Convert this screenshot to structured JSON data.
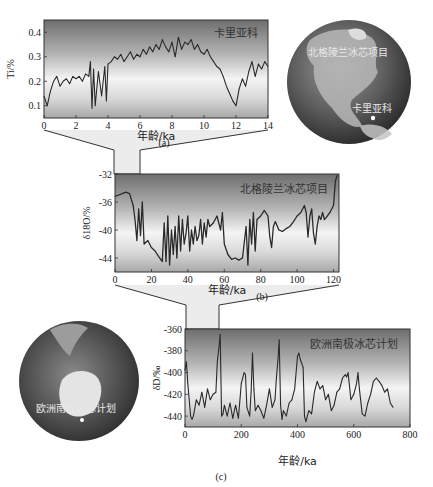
{
  "chart_data": [
    {
      "id": "a",
      "type": "line",
      "caption": "(a)",
      "annotation": "卡里亚科",
      "xlabel": "年龄/ka",
      "ylabel": "Ti/%",
      "xlim": [
        0,
        14
      ],
      "ylim": [
        0.05,
        0.45
      ],
      "xticks": [
        "0",
        "2",
        "4",
        "6",
        "8",
        "10",
        "12",
        "14"
      ],
      "xtick_values": [
        0,
        2,
        4,
        6,
        8,
        10,
        12,
        14
      ],
      "yticks": [
        "0.1",
        "0.2",
        "0.3",
        "0.4"
      ],
      "ytick_values": [
        0.1,
        0.2,
        0.3,
        0.4
      ],
      "series": [
        {
          "name": "Cariaco Ti",
          "x": [
            0,
            0.2,
            0.4,
            0.6,
            0.8,
            1.0,
            1.2,
            1.4,
            1.6,
            1.8,
            2.0,
            2.2,
            2.4,
            2.6,
            2.8,
            2.9,
            3.0,
            3.1,
            3.2,
            3.4,
            3.6,
            3.8,
            3.9,
            4.0,
            4.2,
            4.4,
            4.6,
            4.8,
            5.0,
            5.2,
            5.4,
            5.6,
            5.8,
            6.0,
            6.2,
            6.4,
            6.6,
            6.8,
            7.0,
            7.2,
            7.4,
            7.6,
            7.8,
            8.0,
            8.2,
            8.4,
            8.6,
            8.8,
            9.0,
            9.2,
            9.4,
            9.6,
            9.8,
            10.0,
            10.2,
            10.4,
            10.6,
            10.8,
            11.0,
            11.2,
            11.4,
            11.6,
            11.8,
            12.0,
            12.2,
            12.4,
            12.6,
            12.8,
            13.0,
            13.2,
            13.4,
            13.6,
            13.8,
            14.0
          ],
          "values": [
            0.14,
            0.1,
            0.16,
            0.2,
            0.22,
            0.18,
            0.2,
            0.21,
            0.19,
            0.22,
            0.21,
            0.22,
            0.2,
            0.23,
            0.22,
            0.28,
            0.09,
            0.25,
            0.1,
            0.24,
            0.14,
            0.26,
            0.12,
            0.27,
            0.28,
            0.3,
            0.29,
            0.31,
            0.28,
            0.3,
            0.32,
            0.29,
            0.31,
            0.3,
            0.33,
            0.31,
            0.34,
            0.32,
            0.35,
            0.33,
            0.37,
            0.34,
            0.32,
            0.36,
            0.3,
            0.38,
            0.33,
            0.36,
            0.35,
            0.37,
            0.33,
            0.35,
            0.32,
            0.31,
            0.33,
            0.3,
            0.28,
            0.26,
            0.25,
            0.22,
            0.18,
            0.15,
            0.12,
            0.1,
            0.17,
            0.21,
            0.18,
            0.24,
            0.28,
            0.22,
            0.27,
            0.25,
            0.28,
            0.26
          ]
        }
      ]
    },
    {
      "id": "b",
      "type": "line",
      "caption": "(b)",
      "annotation": "北格陵兰冰芯项目",
      "xlabel": "年龄/ka",
      "ylabel": "δ18O/%",
      "ylabel_parts": {
        "delta": "δ",
        "sup": "18",
        "rest": "O/%"
      },
      "xlim": [
        0,
        123
      ],
      "ylim": [
        -46,
        -32
      ],
      "xticks": [
        "0",
        "20",
        "40",
        "60",
        "80",
        "100",
        "120"
      ],
      "xtick_values": [
        0,
        20,
        40,
        60,
        80,
        100,
        120
      ],
      "yticks": [
        "-32",
        "-36",
        "-40",
        "-44"
      ],
      "ytick_values": [
        -32,
        -36,
        -40,
        -44
      ],
      "series": [
        {
          "name": "NGRIP δ18O",
          "x": [
            0,
            2,
            4,
            6,
            8,
            10,
            11,
            12,
            13,
            14,
            15,
            16,
            18,
            20,
            22,
            24,
            26,
            27,
            28,
            29,
            30,
            31,
            32,
            33,
            34,
            35,
            36,
            37,
            38,
            39,
            40,
            41,
            42,
            43,
            44,
            45,
            46,
            47,
            48,
            49,
            50,
            51,
            52,
            54,
            56,
            58,
            59,
            60,
            62,
            64,
            66,
            68,
            70,
            72,
            73,
            74,
            75,
            76,
            77,
            78,
            80,
            82,
            84,
            85,
            86,
            87,
            88,
            90,
            92,
            94,
            96,
            98,
            100,
            102,
            104,
            105,
            106,
            107,
            108,
            109,
            110,
            111,
            112,
            113,
            114,
            115,
            116,
            118,
            120,
            121,
            122
          ],
          "values": [
            -35.2,
            -35.0,
            -34.8,
            -34.6,
            -34.8,
            -36.5,
            -38.5,
            -41.5,
            -37.0,
            -40.8,
            -36.0,
            -42.0,
            -41.5,
            -42.5,
            -43.0,
            -43.8,
            -44.5,
            -39.0,
            -44.5,
            -38.0,
            -45.0,
            -40.0,
            -43.5,
            -39.5,
            -44.0,
            -38.0,
            -43.0,
            -38.5,
            -42.0,
            -40.5,
            -38.0,
            -43.0,
            -40.0,
            -42.0,
            -39.5,
            -41.5,
            -40.8,
            -38.5,
            -42.0,
            -39.0,
            -41.0,
            -38.5,
            -39.5,
            -39.0,
            -38.0,
            -40.0,
            -37.5,
            -42.0,
            -43.5,
            -44.2,
            -44.0,
            -44.3,
            -44.0,
            -39.5,
            -45.0,
            -38.5,
            -42.0,
            -37.5,
            -43.0,
            -38.5,
            -38.0,
            -37.2,
            -38.0,
            -41.0,
            -42.5,
            -39.5,
            -38.8,
            -40.0,
            -40.2,
            -39.8,
            -39.5,
            -38.8,
            -38.0,
            -37.5,
            -36.5,
            -37.5,
            -41.0,
            -38.0,
            -37.0,
            -40.5,
            -42.0,
            -39.5,
            -38.0,
            -38.5,
            -37.5,
            -38.5,
            -38.2,
            -37.5,
            -36.5,
            -33.0,
            -32.2
          ]
        }
      ]
    },
    {
      "id": "c",
      "type": "line",
      "caption": "(c)",
      "annotation": "欧洲南极冰芯计划",
      "xlabel": "年龄/ka",
      "ylabel": "δD/‰",
      "xlim": [
        0,
        800
      ],
      "ylim": [
        -450,
        -360
      ],
      "xticks": [
        "0",
        "200",
        "400",
        "600",
        "800"
      ],
      "xtick_values": [
        0,
        200,
        400,
        600,
        800
      ],
      "yticks": [
        "-360",
        "-380",
        "-400",
        "-420",
        "-440"
      ],
      "ytick_values": [
        -360,
        -380,
        -400,
        -420,
        -440
      ],
      "series": [
        {
          "name": "EPICA δD",
          "x": [
            0,
            5,
            10,
            15,
            20,
            25,
            30,
            40,
            50,
            60,
            70,
            80,
            90,
            100,
            110,
            115,
            120,
            125,
            130,
            135,
            140,
            150,
            160,
            170,
            180,
            190,
            200,
            210,
            215,
            220,
            230,
            235,
            240,
            245,
            250,
            260,
            270,
            280,
            290,
            300,
            310,
            320,
            325,
            330,
            335,
            340,
            345,
            350,
            360,
            370,
            380,
            390,
            400,
            405,
            410,
            420,
            425,
            430,
            440,
            450,
            460,
            470,
            480,
            490,
            500,
            510,
            520,
            530,
            540,
            550,
            560,
            570,
            575,
            580,
            590,
            600,
            610,
            615,
            620,
            630,
            640,
            650,
            660,
            670,
            680,
            690,
            700,
            710,
            720,
            730,
            740
          ],
          "values": [
            -398,
            -390,
            -410,
            -425,
            -440,
            -443,
            -440,
            -425,
            -430,
            -418,
            -432,
            -415,
            -425,
            -420,
            -418,
            -390,
            -378,
            -365,
            -440,
            -438,
            -430,
            -440,
            -428,
            -442,
            -430,
            -442,
            -410,
            -400,
            -402,
            -432,
            -440,
            -418,
            -382,
            -415,
            -435,
            -430,
            -435,
            -442,
            -430,
            -415,
            -432,
            -425,
            -405,
            -390,
            -370,
            -430,
            -443,
            -435,
            -440,
            -428,
            -425,
            -415,
            -385,
            -382,
            -388,
            -395,
            -440,
            -445,
            -435,
            -438,
            -418,
            -408,
            -415,
            -412,
            -425,
            -420,
            -435,
            -430,
            -418,
            -415,
            -405,
            -402,
            -404,
            -400,
            -425,
            -420,
            -410,
            -400,
            -415,
            -438,
            -440,
            -428,
            -420,
            -408,
            -405,
            -408,
            -412,
            -418,
            -415,
            -428,
            -432
          ]
        }
      ]
    }
  ],
  "globes": [
    {
      "id": "americas",
      "label_project": "北格陵兰冰芯项目",
      "label_site": "卡里亚科"
    },
    {
      "id": "antarctica",
      "label_project": "欧洲南极冰芯计划"
    }
  ]
}
